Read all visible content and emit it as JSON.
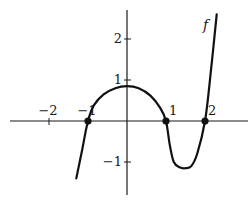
{
  "chart_data": {
    "type": "line",
    "title": "",
    "xlabel": "",
    "ylabel": "",
    "xlim": [
      -3,
      3
    ],
    "ylim": [
      -1.8,
      2.7
    ],
    "grid": false,
    "legend": null,
    "x_ticks": [
      -2,
      -1,
      1,
      2
    ],
    "y_ticks": [
      -1,
      1,
      2
    ],
    "x_tick_labels": [
      "−2",
      "−1",
      "1",
      "2"
    ],
    "y_tick_labels": [
      "−1",
      "1",
      "2"
    ],
    "series": [
      {
        "name": "f",
        "label": "f",
        "color": "#111111",
        "points": [
          [
            -1.3,
            -1.4
          ],
          [
            -1.15,
            -0.7
          ],
          [
            -1.0,
            0.0
          ],
          [
            -0.85,
            0.38
          ],
          [
            -0.6,
            0.65
          ],
          [
            -0.3,
            0.8
          ],
          [
            0.0,
            0.85
          ],
          [
            0.3,
            0.8
          ],
          [
            0.6,
            0.62
          ],
          [
            0.85,
            0.32
          ],
          [
            1.0,
            0.0
          ],
          [
            1.1,
            -0.6
          ],
          [
            1.2,
            -1.0
          ],
          [
            1.35,
            -1.13
          ],
          [
            1.5,
            -1.15
          ],
          [
            1.65,
            -1.1
          ],
          [
            1.8,
            -0.8
          ],
          [
            2.0,
            0.0
          ],
          [
            2.15,
            1.2
          ],
          [
            2.3,
            2.6
          ]
        ]
      }
    ],
    "marked_points": [
      {
        "x": -1,
        "y": 0
      },
      {
        "x": 1,
        "y": 0
      },
      {
        "x": 2,
        "y": 0
      }
    ],
    "annotations": [
      {
        "text": "f",
        "near": [
          2.2,
          2.4
        ]
      }
    ]
  }
}
